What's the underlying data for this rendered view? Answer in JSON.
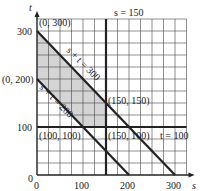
{
  "chart_data": {
    "type": "line",
    "title": "",
    "xlabel": "s",
    "ylabel": "t",
    "xlim": [
      0,
      325
    ],
    "ylim": [
      0,
      325
    ],
    "grid": true,
    "grid_step": 25,
    "x_ticks": [
      {
        "value": 0,
        "label": "0"
      },
      {
        "value": 100,
        "label": "100"
      },
      {
        "value": 200,
        "label": "200"
      },
      {
        "value": 300,
        "label": "300"
      }
    ],
    "y_ticks": [
      {
        "value": 0,
        "label": "0"
      },
      {
        "value": 100,
        "label": "100"
      },
      {
        "value": 300,
        "label": "300"
      }
    ],
    "lines": [
      {
        "name": "s + t = 300",
        "label": "s + t = 300",
        "points": [
          [
            0,
            300
          ],
          [
            300,
            0
          ]
        ]
      },
      {
        "name": "s + t = 200",
        "label": "s + t = 200",
        "points": [
          [
            0,
            200
          ],
          [
            200,
            0
          ]
        ]
      },
      {
        "name": "s = 150",
        "label": "s = 150",
        "points": [
          [
            150,
            0
          ],
          [
            150,
            325
          ]
        ]
      },
      {
        "name": "t = 100",
        "label": "t = 100",
        "points": [
          [
            0,
            100
          ],
          [
            325,
            100
          ]
        ]
      }
    ],
    "shaded_region": {
      "fill": "#d4d4d4",
      "vertices": [
        [
          0,
          300
        ],
        [
          150,
          150
        ],
        [
          150,
          100
        ],
        [
          100,
          100
        ],
        [
          0,
          200
        ]
      ]
    },
    "annotations": [
      {
        "text": "(0, 300)",
        "point": [
          0,
          300
        ]
      },
      {
        "text": "(0, 200)",
        "point": [
          0,
          200
        ]
      },
      {
        "text": "(150, 150)",
        "point": [
          150,
          150
        ]
      },
      {
        "text": "(100, 100)",
        "point": [
          100,
          100
        ]
      },
      {
        "text": "(150, 100)",
        "point": [
          150,
          100
        ]
      }
    ]
  }
}
